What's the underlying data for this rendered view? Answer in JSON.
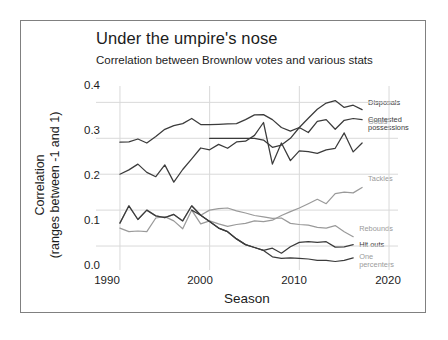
{
  "chart_data": {
    "type": "line",
    "title": "Under the umpire's nose",
    "subtitle": "Correlation between Brownlow votes and various stats",
    "xlabel": "Season",
    "ylabel_line1": "Correlation",
    "ylabel_line2": "(ranges between -1 and 1)",
    "xlim": [
      1988,
      2021
    ],
    "ylim": [
      -0.05,
      0.44
    ],
    "xticks": [
      1990,
      2000,
      2010,
      2020
    ],
    "xtick_labels": [
      "1990",
      "2000",
      "2010",
      "2020"
    ],
    "yticks": [
      0.0,
      0.1,
      0.2,
      0.3,
      0.4
    ],
    "ytick_labels": [
      "0.0",
      "0.1",
      "0.2",
      "0.3",
      "0.4"
    ],
    "grid": true,
    "legend_position": "right-inline",
    "colors": {
      "dark": "#3b3b3b",
      "light": "#9a9a9a",
      "grid": "#d9d9d9",
      "frame": "#808080",
      "text": "#1c1c1c"
    },
    "series": [
      {
        "name": "Disposals",
        "label": "Disposals",
        "color": "#3b3b3b",
        "x": [
          1990,
          1991,
          1992,
          1993,
          1994,
          1995,
          1996,
          1997,
          1998,
          1999,
          2000,
          2001,
          2002,
          2003,
          2004,
          2005,
          2006,
          2007,
          2008,
          2009,
          2010,
          2011,
          2012,
          2013,
          2014,
          2015,
          2016,
          2017
        ],
        "values": [
          0.289,
          0.29,
          0.298,
          0.287,
          0.305,
          0.325,
          0.335,
          0.341,
          0.355,
          0.338,
          0.338,
          0.339,
          0.34,
          0.341,
          0.352,
          0.365,
          0.366,
          0.352,
          0.33,
          0.32,
          0.33,
          0.356,
          0.381,
          0.398,
          0.405,
          0.386,
          0.392,
          0.38
        ]
      },
      {
        "name": "Contested possessions",
        "label": "Contested\npossessions",
        "color": "#3b3b3b",
        "x": [
          2000,
          2001,
          2002,
          2003,
          2004,
          2005,
          2006,
          2007,
          2008,
          2009,
          2010,
          2011,
          2012,
          2013,
          2014,
          2015,
          2016,
          2017
        ],
        "values": [
          0.3,
          0.3,
          0.3,
          0.3,
          0.3,
          0.3,
          0.295,
          0.275,
          0.281,
          0.3,
          0.33,
          0.316,
          0.347,
          0.352,
          0.325,
          0.35,
          0.355,
          0.352
        ]
      },
      {
        "name": "Goals",
        "label": "Goals",
        "color": "#3b3b3b",
        "x": [
          1990,
          1991,
          1992,
          1993,
          1994,
          1995,
          1996,
          1997,
          1998,
          1999,
          2000,
          2001,
          2002,
          2003,
          2004,
          2005,
          2006,
          2007,
          2008,
          2009,
          2010,
          2011,
          2012,
          2013,
          2014,
          2015,
          2016,
          2017
        ],
        "values": [
          0.2,
          0.212,
          0.228,
          0.205,
          0.193,
          0.226,
          0.178,
          0.213,
          0.243,
          0.273,
          0.268,
          0.283,
          0.272,
          0.29,
          0.292,
          0.308,
          0.344,
          0.228,
          0.287,
          0.238,
          0.265,
          0.263,
          0.258,
          0.268,
          0.272,
          0.315,
          0.262,
          0.287
        ]
      },
      {
        "name": "Tackles",
        "label": "Tackles",
        "color": "#9a9a9a",
        "x": [
          1990,
          1991,
          1992,
          1993,
          1994,
          1995,
          1996,
          1997,
          1998,
          1999,
          2000,
          2001,
          2002,
          2003,
          2004,
          2005,
          2006,
          2007,
          2008,
          2009,
          2010,
          2011,
          2012,
          2013,
          2014,
          2015,
          2016,
          2017
        ],
        "values": [
          0.05,
          0.04,
          0.042,
          0.04,
          0.078,
          0.082,
          0.07,
          0.048,
          0.1,
          0.062,
          0.07,
          0.062,
          0.055,
          0.06,
          0.063,
          0.07,
          0.068,
          0.072,
          0.085,
          0.096,
          0.106,
          0.118,
          0.13,
          0.118,
          0.146,
          0.15,
          0.148,
          0.163
        ]
      },
      {
        "name": "Rebounds",
        "label": "Rebounds",
        "color": "#9a9a9a",
        "x": [
          1990,
          1991,
          1992,
          1993,
          1994,
          1995,
          1996,
          1997,
          1998,
          1999,
          2000,
          2001,
          2002,
          2003,
          2004,
          2005,
          2006,
          2007,
          2008,
          2009,
          2010,
          2011,
          2012,
          2013,
          2014,
          2015,
          2016
        ],
        "values": [
          0.064,
          0.112,
          0.074,
          0.1,
          0.084,
          0.079,
          0.088,
          0.07,
          0.112,
          0.086,
          0.1,
          0.104,
          0.106,
          0.098,
          0.092,
          0.085,
          0.081,
          0.077,
          0.078,
          0.063,
          0.06,
          0.058,
          0.052,
          0.05,
          0.057,
          0.04,
          0.026
        ]
      },
      {
        "name": "Hit outs",
        "label": "Hit outs",
        "color": "#3b3b3b",
        "x": [
          1990,
          1991,
          1992,
          1993,
          1994,
          1995,
          1996,
          1997,
          1998,
          1999,
          2000,
          2001,
          2002,
          2003,
          2004,
          2005,
          2006,
          2007,
          2008,
          2009,
          2010,
          2011,
          2012,
          2013,
          2014,
          2015,
          2016
        ],
        "values": [
          0.064,
          0.112,
          0.074,
          0.1,
          0.084,
          0.079,
          0.088,
          0.07,
          0.112,
          0.086,
          0.068,
          0.05,
          0.04,
          0.02,
          0.004,
          -0.004,
          -0.012,
          -0.006,
          -0.02,
          -0.002,
          0.01,
          0.012,
          0.01,
          0.012,
          -0.003,
          -0.002,
          0.004
        ]
      },
      {
        "name": "One percenters",
        "label": "One\npercenters",
        "color": "#3b3b3b",
        "x": [
          1998,
          1999,
          2000,
          2001,
          2002,
          2003,
          2004,
          2005,
          2006,
          2007,
          2008,
          2009,
          2010,
          2011,
          2012,
          2013,
          2014,
          2015,
          2016
        ],
        "values": [
          0.1,
          0.086,
          0.068,
          0.05,
          0.04,
          0.02,
          0.004,
          -0.004,
          -0.012,
          -0.03,
          -0.034,
          -0.033,
          -0.034,
          -0.036,
          -0.04,
          -0.04,
          -0.043,
          -0.04,
          -0.033
        ]
      }
    ],
    "legend_labels": {
      "disposals": "Disposals",
      "contested": "Contested\npossessions",
      "goals": "Goals",
      "tackles": "Tackles",
      "rebounds": "Rebounds",
      "hitouts": "Hit outs",
      "onepercenters": "One\npercenters"
    }
  }
}
